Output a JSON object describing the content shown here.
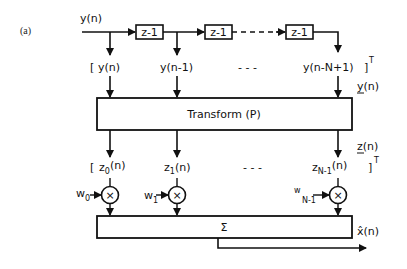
{
  "figure": {
    "panel_label": "(a)",
    "input_label": "y(n)",
    "delay_label": "z-1",
    "delays": [
      "z-1",
      "z-1",
      "z-1"
    ],
    "input_vector": {
      "open_bracket": "[",
      "taps": [
        "y(n)",
        "y(n-1)",
        "y(n-N+1)"
      ],
      "ellipsis": "- - -",
      "close": "]",
      "transpose": "T",
      "vector_name": "y(n)"
    },
    "transform_label": "Transform (P)",
    "output_vector": {
      "open_bracket": "[",
      "taps": [
        {
          "base": "z",
          "sub": "0",
          "arg": "(n)"
        },
        {
          "base": "z",
          "sub": "1",
          "arg": "(n)"
        },
        {
          "base": "z",
          "sub": "N-1",
          "arg": "(n)"
        }
      ],
      "ellipsis": "- - -",
      "close": "]",
      "transpose": "T",
      "vector_name": "z(n)"
    },
    "weights": [
      {
        "base": "w",
        "sub": "0"
      },
      {
        "base": "w",
        "sub": "1"
      },
      {
        "base": "w",
        "sub": "N-1"
      }
    ],
    "multiplier_symbol": "×",
    "sum_label": "Σ",
    "output_label": "x̂(n)"
  }
}
